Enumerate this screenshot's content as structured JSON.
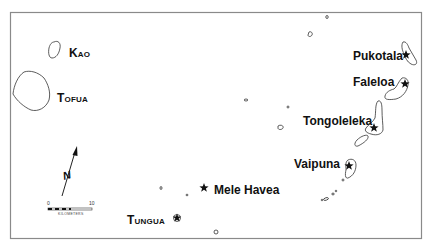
{
  "map": {
    "colors": {
      "background": "#ffffff",
      "frame": "#8a8a8a",
      "coastline": "#333333",
      "text": "#111111",
      "marker": "#111111"
    },
    "islands": [
      {
        "name": "Kao",
        "style": "caps"
      },
      {
        "name": "Tofua",
        "style": "caps"
      },
      {
        "name": "Tungua",
        "style": "caps"
      }
    ],
    "settlements": [
      {
        "name": "Pukotala",
        "marker": "star"
      },
      {
        "name": "Faleloa",
        "marker": "star"
      },
      {
        "name": "Tongoleleka",
        "marker": "star"
      },
      {
        "name": "Vaipuna",
        "marker": "star"
      },
      {
        "name": "Mele Havea",
        "marker": "star"
      }
    ],
    "north_arrow": {
      "label": "N"
    },
    "scale_bar": {
      "min": "0",
      "max": "10",
      "unit": "Kilometers"
    }
  }
}
